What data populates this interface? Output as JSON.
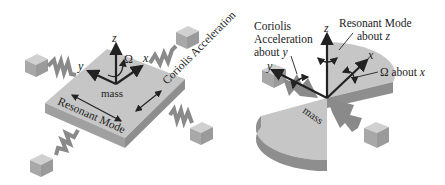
{
  "colors": {
    "top_face": "#c6c6c6",
    "side_face": "#9a9a9a",
    "dark_face": "#8a8a8a",
    "block_top": "#d0d0d0",
    "block_side": "#a8a8a8",
    "arrow": "#222222",
    "background": "#ffffff"
  },
  "left_diagram": {
    "axes": {
      "z": "z",
      "y": "y",
      "x": "x"
    },
    "omega": "Ω",
    "mass_label": "mass",
    "coriolis_label": "Coriolis Acceleration",
    "resonant_label": "Resonant Mode"
  },
  "right_diagram": {
    "axes": {
      "z": "z",
      "y": "y",
      "x": "x"
    },
    "mass_label": "mass",
    "coriolis_line1": "Coriolis",
    "coriolis_line2": "Acceleration",
    "coriolis_line3_prefix": "about ",
    "coriolis_line3_axis": "y",
    "resonant_line1": "Resonant Mode",
    "resonant_line2_prefix": "about ",
    "resonant_line2_axis": "z",
    "omega_label_symbol": "Ω",
    "omega_label_prefix": " about ",
    "omega_label_axis": "x"
  }
}
